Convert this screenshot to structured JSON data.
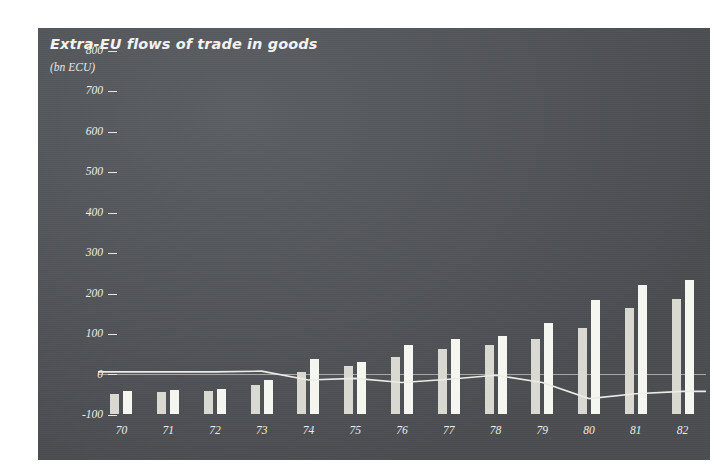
{
  "chart_data": {
    "type": "bar",
    "title": "Extra-EU flows of trade in goods",
    "subtitle": "(bn ECU)",
    "unit_label": "(bn ECU)",
    "xlabel": "",
    "ylabel": "bn ECU",
    "categories": [
      "70",
      "71",
      "72",
      "73",
      "74",
      "75",
      "76",
      "77",
      "78",
      "79",
      "80",
      "81",
      "82"
    ],
    "ylim": [
      -100,
      800
    ],
    "yticks": [
      "800",
      "700",
      "600",
      "500",
      "400",
      "300",
      "200",
      "100",
      "0",
      "-100"
    ],
    "ytick_values": [
      800,
      700,
      600,
      500,
      400,
      300,
      200,
      100,
      0,
      -100
    ],
    "grid": false,
    "legend": "none",
    "series": [
      {
        "name": "Imports",
        "type": "bar",
        "values": [
          50,
          55,
          58,
          72,
          105,
          118,
          140,
          160,
          170,
          185,
          212,
          262,
          285
        ]
      },
      {
        "name": "Exports",
        "type": "bar",
        "values": [
          56,
          60,
          63,
          84,
          135,
          128,
          170,
          185,
          192,
          225,
          282,
          320,
          332
        ]
      },
      {
        "name": "Balance",
        "type": "line",
        "values": [
          4,
          4,
          4,
          6,
          -16,
          -12,
          -22,
          -14,
          -4,
          -22,
          -62,
          -50,
          -44
        ]
      }
    ],
    "annotations": []
  },
  "figure": {
    "title": "Extra-EU flows of trade in goods",
    "unit": "(bn ECU)",
    "panel_color": "#53565a",
    "bar_color_imports": "#d9d9d2",
    "bar_color_exports": "#f6f6f1",
    "line_color": "#ececE6",
    "text_color": "#ededea"
  }
}
